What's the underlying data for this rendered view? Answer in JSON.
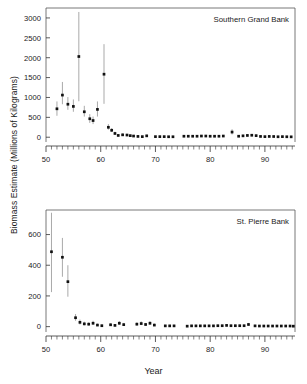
{
  "figure": {
    "ylabel": "Biomass Estimate (Millions of Kilograms)",
    "xlabel": "Year"
  },
  "chart_data": [
    {
      "type": "scatter",
      "title": "Southern Grand Bank",
      "xlabel": "Year",
      "ylabel": "Biomass Estimate (Millions of Kilograms)",
      "xlim": [
        50,
        95.5
      ],
      "ylim": [
        -120,
        3250
      ],
      "xticks": [
        50,
        60,
        70,
        80,
        90
      ],
      "xticklabels": [
        "50",
        "60",
        "70",
        "80",
        "90"
      ],
      "yticks": [
        0,
        500,
        1000,
        1500,
        2000,
        2500,
        3000
      ],
      "yticklabels": [
        "0",
        "500",
        "1000",
        "1500",
        "2000",
        "2500",
        "3000"
      ],
      "minor_xtick_step": 1,
      "grid": false,
      "legend": false,
      "errorbars": true,
      "x": [
        52,
        53,
        54,
        55,
        56,
        57,
        58,
        58.6,
        59.4,
        60.6,
        61.4,
        62,
        62.6,
        63.2,
        64,
        64.8,
        65.4,
        66,
        66.8,
        67.6,
        68.4,
        70,
        70.8,
        71.6,
        72.4,
        73.2,
        75.2,
        76,
        76.8,
        77.6,
        78.4,
        79.2,
        80,
        80.8,
        81.6,
        82.4,
        84,
        85.2,
        86,
        86.8,
        87.6,
        88.4,
        89.2,
        90,
        90.8,
        91.6,
        92.4,
        93.2,
        94,
        94.8
      ],
      "y": [
        715,
        1060,
        830,
        775,
        2030,
        640,
        465,
        420,
        700,
        1585,
        250,
        175,
        95,
        45,
        60,
        55,
        40,
        30,
        20,
        15,
        35,
        15,
        15,
        15,
        12,
        12,
        25,
        25,
        25,
        25,
        30,
        30,
        25,
        25,
        25,
        30,
        130,
        25,
        35,
        45,
        50,
        40,
        20,
        15,
        20,
        18,
        12,
        15,
        12,
        10
      ],
      "yerr_low": [
        540,
        830,
        690,
        640,
        905,
        520,
        360,
        330,
        520,
        840,
        190,
        130,
        60,
        25,
        35,
        30,
        20,
        15,
        5,
        5,
        15,
        5,
        5,
        5,
        3,
        3,
        10,
        10,
        10,
        10,
        12,
        12,
        10,
        10,
        10,
        12,
        70,
        10,
        15,
        22,
        25,
        18,
        8,
        5,
        8,
        7,
        4,
        5,
        4,
        3
      ],
      "yerr_high": [
        900,
        1390,
        1010,
        950,
        3150,
        790,
        580,
        520,
        900,
        2340,
        330,
        230,
        140,
        75,
        95,
        85,
        65,
        50,
        40,
        30,
        60,
        30,
        30,
        30,
        25,
        25,
        45,
        45,
        45,
        45,
        50,
        50,
        45,
        45,
        45,
        50,
        200,
        45,
        60,
        72,
        80,
        65,
        38,
        30,
        36,
        33,
        25,
        28,
        24,
        20
      ]
    },
    {
      "type": "scatter",
      "title": "St. Pierre Bank",
      "xlabel": "Year",
      "ylabel": "Biomass Estimate (Millions of Kilograms)",
      "xlim": [
        50,
        95.5
      ],
      "ylim": [
        -35,
        760
      ],
      "xticks": [
        50,
        60,
        70,
        80,
        90
      ],
      "xticklabels": [
        "50",
        "60",
        "70",
        "80",
        "90"
      ],
      "yticks": [
        0,
        200,
        400,
        600
      ],
      "yticklabels": [
        "0",
        "200",
        "400",
        "600"
      ],
      "minor_xtick_step": 1,
      "grid": false,
      "legend": false,
      "errorbars": true,
      "x": [
        51,
        53,
        54,
        55.4,
        56.2,
        57,
        57.8,
        58.6,
        59.4,
        60.2,
        61.8,
        62.6,
        63.4,
        64.2,
        66.6,
        67.4,
        68.2,
        69,
        69.8,
        71.8,
        72.6,
        73.4,
        75.8,
        76.6,
        77.4,
        78.2,
        79,
        79.8,
        80.6,
        81.4,
        82.2,
        83,
        83.8,
        84.6,
        85.4,
        86.2,
        87,
        88.2,
        89,
        89.8,
        90.6,
        91.4,
        92.2,
        93,
        93.8,
        94.6,
        95.2
      ],
      "y": [
        488,
        452,
        293,
        58,
        28,
        18,
        16,
        22,
        10,
        6,
        12,
        8,
        22,
        13,
        16,
        20,
        14,
        22,
        10,
        5,
        5,
        5,
        3,
        5,
        5,
        5,
        5,
        5,
        5,
        6,
        6,
        8,
        6,
        6,
        6,
        6,
        14,
        5,
        4,
        4,
        4,
        4,
        4,
        4,
        4,
        4,
        3
      ],
      "yerr_low": [
        225,
        325,
        195,
        38,
        14,
        8,
        7,
        11,
        4,
        2,
        5,
        3,
        11,
        6,
        7,
        10,
        6,
        11,
        4,
        2,
        2,
        2,
        1,
        2,
        2,
        2,
        2,
        2,
        2,
        2,
        2,
        3,
        2,
        2,
        2,
        2,
        6,
        2,
        1,
        1,
        1,
        1,
        1,
        1,
        1,
        1,
        1
      ],
      "yerr_high": [
        742,
        578,
        400,
        82,
        46,
        32,
        28,
        38,
        20,
        14,
        22,
        16,
        36,
        24,
        28,
        34,
        24,
        36,
        20,
        11,
        11,
        11,
        8,
        11,
        11,
        11,
        11,
        11,
        11,
        12,
        12,
        15,
        12,
        12,
        12,
        12,
        24,
        11,
        9,
        9,
        9,
        9,
        9,
        9,
        9,
        9,
        8
      ]
    }
  ]
}
